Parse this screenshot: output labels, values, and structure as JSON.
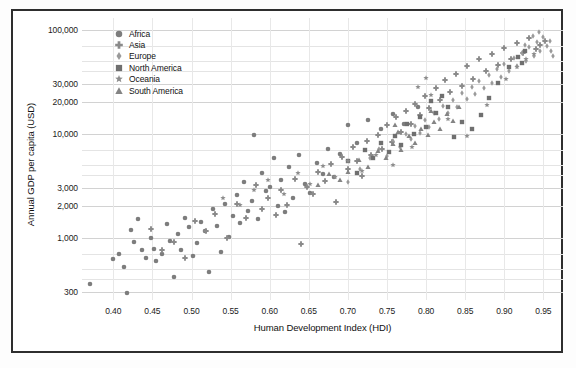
{
  "chart_data": {
    "type": "scatter",
    "title": "",
    "xlabel": "Human Development Index (HDI)",
    "ylabel": "Annual GDP per capita (USD)",
    "xlim": [
      0.36,
      0.975
    ],
    "ylim": [
      250,
      130000
    ],
    "yscale": "log",
    "xscale": "linear",
    "grid": true,
    "legend_position": "top-left-inside",
    "xticks": [
      "0.40",
      "0.45",
      "0.50",
      "0.55",
      "0.60",
      "0.65",
      "0.70",
      "0.75",
      "0.80",
      "0.85",
      "0.90",
      "0.95"
    ],
    "xtick_values": [
      0.4,
      0.45,
      0.5,
      0.55,
      0.6,
      0.65,
      0.7,
      0.75,
      0.8,
      0.85,
      0.9,
      0.95
    ],
    "yticks": [
      "100,000",
      "30,000",
      "20,000",
      "10,000",
      "3,000",
      "2,000",
      "1,000",
      "300"
    ],
    "ytick_values": [
      100000,
      30000,
      20000,
      10000,
      3000,
      2000,
      1000,
      300
    ],
    "y_gridline_values": [
      100000,
      70000,
      50000,
      40000,
      30000,
      20000,
      10000,
      7000,
      5000,
      4000,
      3000,
      2000,
      1000,
      700,
      500,
      400,
      300
    ],
    "marker_color": "#808080",
    "series": [
      {
        "name": "Africa",
        "marker": "circle",
        "color": "#7d7d7d",
        "points": [
          [
            0.37,
            360
          ],
          [
            0.4,
            620
          ],
          [
            0.407,
            700
          ],
          [
            0.413,
            520
          ],
          [
            0.418,
            290
          ],
          [
            0.423,
            1180
          ],
          [
            0.427,
            900
          ],
          [
            0.432,
            1500
          ],
          [
            0.437,
            760
          ],
          [
            0.442,
            640
          ],
          [
            0.448,
            1000
          ],
          [
            0.452,
            780
          ],
          [
            0.455,
            600
          ],
          [
            0.462,
            700
          ],
          [
            0.468,
            1350
          ],
          [
            0.472,
            930
          ],
          [
            0.477,
            420
          ],
          [
            0.483,
            1080
          ],
          [
            0.487,
            760
          ],
          [
            0.492,
            1550
          ],
          [
            0.497,
            1250
          ],
          [
            0.502,
            660
          ],
          [
            0.507,
            880
          ],
          [
            0.512,
            1420
          ],
          [
            0.517,
            1150
          ],
          [
            0.522,
            470
          ],
          [
            0.527,
            1900
          ],
          [
            0.533,
            1300
          ],
          [
            0.538,
            720
          ],
          [
            0.543,
            2100
          ],
          [
            0.548,
            1020
          ],
          [
            0.553,
            1600
          ],
          [
            0.558,
            2550
          ],
          [
            0.562,
            1380
          ],
          [
            0.567,
            3400
          ],
          [
            0.572,
            1800
          ],
          [
            0.577,
            2250
          ],
          [
            0.58,
            9800
          ],
          [
            0.585,
            1500
          ],
          [
            0.59,
            4200
          ],
          [
            0.595,
            2800
          ],
          [
            0.6,
            3100
          ],
          [
            0.605,
            5900
          ],
          [
            0.61,
            2000
          ],
          [
            0.615,
            3600
          ],
          [
            0.62,
            1750
          ],
          [
            0.625,
            4800
          ],
          [
            0.63,
            2400
          ],
          [
            0.638,
            6200
          ],
          [
            0.645,
            3300
          ],
          [
            0.652,
            2700
          ],
          [
            0.66,
            5200
          ],
          [
            0.668,
            4100
          ],
          [
            0.675,
            7200
          ],
          [
            0.682,
            3800
          ],
          [
            0.69,
            6400
          ],
          [
            0.7,
            12000
          ],
          [
            0.712,
            8200
          ],
          [
            0.725,
            13500
          ],
          [
            0.742,
            11000
          ],
          [
            0.758,
            15500
          ],
          [
            0.772,
            12500
          ],
          [
            0.79,
            18000
          ]
        ]
      },
      {
        "name": "Asia",
        "marker": "plus",
        "color": "#8a8a8a",
        "points": [
          [
            0.448,
            1200
          ],
          [
            0.462,
            760
          ],
          [
            0.478,
            900
          ],
          [
            0.492,
            640
          ],
          [
            0.505,
            1450
          ],
          [
            0.518,
            1150
          ],
          [
            0.53,
            1700
          ],
          [
            0.545,
            980
          ],
          [
            0.558,
            2100
          ],
          [
            0.57,
            1550
          ],
          [
            0.582,
            3200
          ],
          [
            0.59,
            1900
          ],
          [
            0.598,
            2400
          ],
          [
            0.608,
            1650
          ],
          [
            0.615,
            2900
          ],
          [
            0.622,
            2050
          ],
          [
            0.632,
            3700
          ],
          [
            0.64,
            860
          ],
          [
            0.648,
            3100
          ],
          [
            0.655,
            2600
          ],
          [
            0.662,
            4300
          ],
          [
            0.67,
            3500
          ],
          [
            0.678,
            5100
          ],
          [
            0.685,
            2200
          ],
          [
            0.692,
            6000
          ],
          [
            0.7,
            4600
          ],
          [
            0.706,
            7500
          ],
          [
            0.712,
            5400
          ],
          [
            0.718,
            3900
          ],
          [
            0.724,
            8600
          ],
          [
            0.73,
            6200
          ],
          [
            0.738,
            9800
          ],
          [
            0.744,
            7100
          ],
          [
            0.75,
            12000
          ],
          [
            0.756,
            8400
          ],
          [
            0.762,
            14500
          ],
          [
            0.768,
            10500
          ],
          [
            0.774,
            16500
          ],
          [
            0.78,
            12500
          ],
          [
            0.786,
            19500
          ],
          [
            0.792,
            15000
          ],
          [
            0.798,
            23000
          ],
          [
            0.804,
            17500
          ],
          [
            0.812,
            27500
          ],
          [
            0.818,
            21000
          ],
          [
            0.824,
            33000
          ],
          [
            0.83,
            25000
          ],
          [
            0.838,
            38000
          ],
          [
            0.846,
            29000
          ],
          [
            0.852,
            45000
          ],
          [
            0.86,
            34000
          ],
          [
            0.868,
            52000
          ],
          [
            0.876,
            40000
          ],
          [
            0.884,
            58000
          ],
          [
            0.892,
            46000
          ],
          [
            0.9,
            67000
          ],
          [
            0.908,
            52000
          ],
          [
            0.916,
            75000
          ],
          [
            0.924,
            60000
          ],
          [
            0.932,
            84000
          ],
          [
            0.94,
            66000
          ],
          [
            0.946,
            72000
          ],
          [
            0.952,
            78000
          ]
        ]
      },
      {
        "name": "Europe",
        "marker": "diamond",
        "color": "#9a9a9a",
        "points": [
          [
            0.7,
            3400
          ],
          [
            0.715,
            4600
          ],
          [
            0.728,
            5800
          ],
          [
            0.74,
            7200
          ],
          [
            0.75,
            6100
          ],
          [
            0.758,
            8500
          ],
          [
            0.766,
            7400
          ],
          [
            0.774,
            10000
          ],
          [
            0.78,
            8800
          ],
          [
            0.786,
            11800
          ],
          [
            0.792,
            10200
          ],
          [
            0.798,
            13500
          ],
          [
            0.804,
            11500
          ],
          [
            0.81,
            15800
          ],
          [
            0.816,
            13800
          ],
          [
            0.822,
            18500
          ],
          [
            0.828,
            16000
          ],
          [
            0.834,
            21000
          ],
          [
            0.84,
            18200
          ],
          [
            0.846,
            24500
          ],
          [
            0.852,
            21500
          ],
          [
            0.858,
            28000
          ],
          [
            0.862,
            24000
          ],
          [
            0.868,
            32000
          ],
          [
            0.874,
            27500
          ],
          [
            0.88,
            36500
          ],
          [
            0.884,
            31000
          ],
          [
            0.89,
            42000
          ],
          [
            0.896,
            35500
          ],
          [
            0.9,
            47000
          ],
          [
            0.906,
            40000
          ],
          [
            0.912,
            54000
          ],
          [
            0.916,
            45000
          ],
          [
            0.922,
            60000
          ],
          [
            0.928,
            50000
          ],
          [
            0.932,
            68000
          ],
          [
            0.938,
            56000
          ],
          [
            0.942,
            76000
          ],
          [
            0.946,
            63000
          ],
          [
            0.95,
            85000
          ],
          [
            0.954,
            70000
          ],
          [
            0.958,
            79000
          ],
          [
            0.944,
            95000
          ],
          [
            0.936,
            88000
          ],
          [
            0.926,
            72000
          ],
          [
            0.96,
            62000
          ],
          [
            0.962,
            56000
          ]
        ]
      },
      {
        "name": "North America",
        "marker": "square",
        "color": "#6f6f6f",
        "points": [
          [
            0.7,
            5400
          ],
          [
            0.712,
            4200
          ],
          [
            0.722,
            7000
          ],
          [
            0.732,
            5800
          ],
          [
            0.742,
            8200
          ],
          [
            0.752,
            6600
          ],
          [
            0.76,
            9600
          ],
          [
            0.768,
            7800
          ],
          [
            0.776,
            12500
          ],
          [
            0.784,
            10000
          ],
          [
            0.792,
            14500
          ],
          [
            0.8,
            11500
          ],
          [
            0.806,
            20500
          ],
          [
            0.812,
            16000
          ],
          [
            0.82,
            23000
          ],
          [
            0.828,
            18000
          ],
          [
            0.836,
            9200
          ],
          [
            0.846,
            13000
          ],
          [
            0.858,
            11000
          ],
          [
            0.87,
            15000
          ],
          [
            0.88,
            22000
          ],
          [
            0.892,
            31000
          ],
          [
            0.906,
            44000
          ],
          [
            0.918,
            55000
          ],
          [
            0.926,
            62000
          ],
          [
            0.922,
            48000
          ]
        ]
      },
      {
        "name": "Oceania",
        "marker": "star",
        "color": "#8d8d8d",
        "points": [
          [
            0.54,
            2400
          ],
          [
            0.562,
            2050
          ],
          [
            0.58,
            2900
          ],
          [
            0.598,
            3600
          ],
          [
            0.618,
            2600
          ],
          [
            0.636,
            4200
          ],
          [
            0.652,
            3300
          ],
          [
            0.668,
            4900
          ],
          [
            0.684,
            3800
          ],
          [
            0.7,
            5500
          ],
          [
            0.718,
            4400
          ],
          [
            0.736,
            6300
          ],
          [
            0.758,
            5000
          ],
          [
            0.782,
            7400
          ],
          [
            0.806,
            23500
          ],
          [
            0.828,
            14000
          ],
          [
            0.852,
            9500
          ],
          [
            0.878,
            19000
          ],
          [
            0.902,
            34000
          ],
          [
            0.916,
            44000
          ],
          [
            0.928,
            52000
          ],
          [
            0.938,
            58000
          ],
          [
            0.79,
            28000
          ],
          [
            0.8,
            34500
          ]
        ]
      },
      {
        "name": "South America",
        "marker": "triangle",
        "color": "#848484",
        "points": [
          [
            0.7,
            4300
          ],
          [
            0.714,
            5600
          ],
          [
            0.726,
            4800
          ],
          [
            0.738,
            6800
          ],
          [
            0.748,
            5900
          ],
          [
            0.758,
            8000
          ],
          [
            0.768,
            6900
          ],
          [
            0.778,
            9500
          ],
          [
            0.786,
            8200
          ],
          [
            0.794,
            11200
          ],
          [
            0.802,
            9800
          ],
          [
            0.81,
            13000
          ],
          [
            0.818,
            11000
          ],
          [
            0.826,
            15500
          ],
          [
            0.834,
            13200
          ],
          [
            0.842,
            18000
          ],
          [
            0.69,
            3600
          ],
          [
            0.676,
            4100
          ],
          [
            0.662,
            3200
          ],
          [
            0.764,
            10500
          ],
          [
            0.806,
            16500
          ],
          [
            0.76,
            12000
          ]
        ]
      }
    ]
  },
  "axes": {
    "y_title": "Annual GDP per capita (USD)",
    "x_title": "Human Development Index (HDI)"
  },
  "legend": {
    "items": [
      {
        "label": "Africa",
        "marker": "circle-icon"
      },
      {
        "label": "Asia",
        "marker": "plus-icon"
      },
      {
        "label": "Europe",
        "marker": "diamond-icon"
      },
      {
        "label": "North America",
        "marker": "square-icon"
      },
      {
        "label": "Oceania",
        "marker": "star-icon"
      },
      {
        "label": "South America",
        "marker": "triangle-icon"
      }
    ]
  }
}
